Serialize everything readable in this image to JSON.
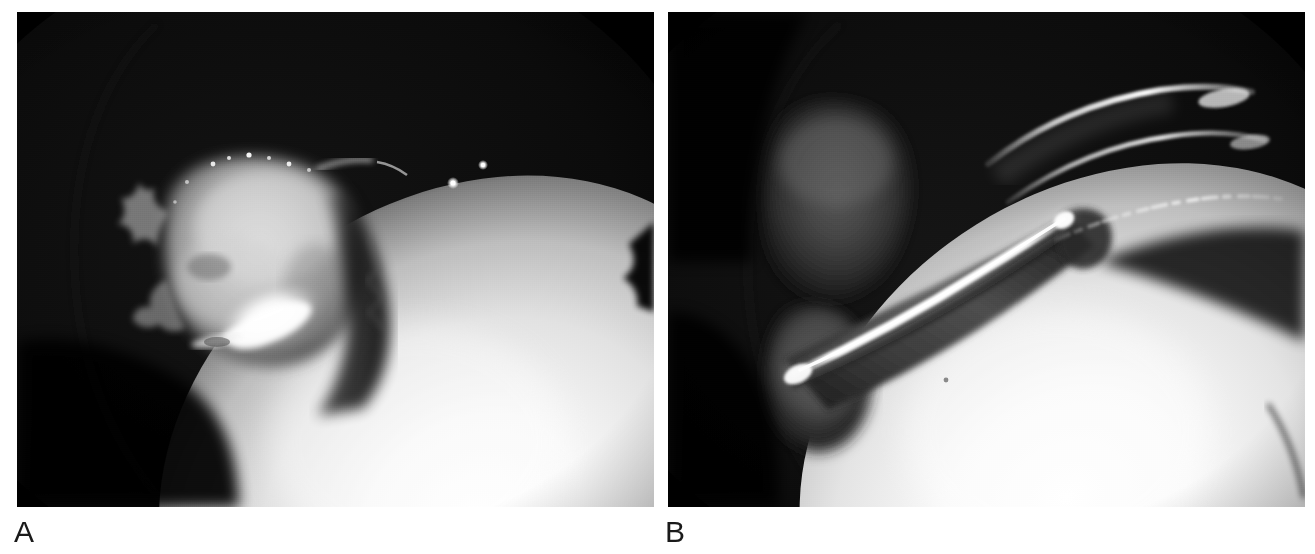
{
  "figure": {
    "kind": "two-panel grayscale endoscopic surgical photograph",
    "background_color": "#ffffff",
    "width": 1315,
    "height": 554
  },
  "panels": [
    {
      "id": "A",
      "label": "A",
      "label_color": "#1a1a1a",
      "frame": {
        "x": 17,
        "y": 12,
        "width": 637,
        "height": 495
      },
      "background_color": "#000000",
      "description": "Endoscopic view of an irregular pale soft-tissue mass at left with a bright specular flare at its inferior margin, adjacent to a large smooth brightly illuminated convex structure occupying the lower-right field.",
      "features": [
        {
          "name": "tissue-mass",
          "tone": "#b9b9b9",
          "note": "irregular granular pale lesion, upper-left of field"
        },
        {
          "name": "specular-flare",
          "tone": "#ffffff",
          "note": "bright white highlight at inferior lesion margin"
        },
        {
          "name": "bright-convex-structure",
          "tone": "#f2f2f2",
          "note": "large smooth ellipsoid, lower-right"
        },
        {
          "name": "specular-dots",
          "tone": "#ffffff",
          "note": "two small bright points above the convex structure"
        },
        {
          "name": "endoscope-vignette",
          "tone": "#0a0a0a",
          "note": "faint circular field-of-view arc, upper left"
        }
      ]
    },
    {
      "id": "B",
      "label": "B",
      "label_color": "#1a1a1a",
      "frame": {
        "x": 668,
        "y": 12,
        "width": 637,
        "height": 495
      },
      "background_color": "#000000",
      "description": "Endoscopic view of an elongated metallic surgical instrument entering from the left with a long linear specular reflection along its shaft and curved bright arc highlights at its tip, positioned against the same large smooth brightly illuminated convex structure.",
      "features": [
        {
          "name": "instrument-shaft",
          "tone": "#2e2e2e",
          "note": "elongated metallic shaft running lower-left to upper-right"
        },
        {
          "name": "shaft-specular-streak",
          "tone": "#ffffff",
          "note": "long bright linear reflection along the shaft"
        },
        {
          "name": "tip-arc-highlights",
          "tone": "#e8e8e8",
          "note": "curved bright reflections at the instrument tip, upper right"
        },
        {
          "name": "dim-tissue-mass",
          "tone": "#3a3a3a",
          "note": "dim grey soft-tissue mound, left of field"
        },
        {
          "name": "bright-convex-structure",
          "tone": "#f2f2f2",
          "note": "large smooth ellipsoid, lower-right"
        },
        {
          "name": "endoscope-vignette",
          "tone": "#0a0a0a",
          "note": "faint circular field-of-view arc, upper left"
        }
      ]
    }
  ],
  "colors": {
    "page_background": "#ffffff",
    "panel_background": "#000000",
    "label_text": "#1a1a1a",
    "highlight_white": "#ffffff",
    "mid_grey": "#b9b9b9",
    "dark_grey": "#2e2e2e"
  }
}
